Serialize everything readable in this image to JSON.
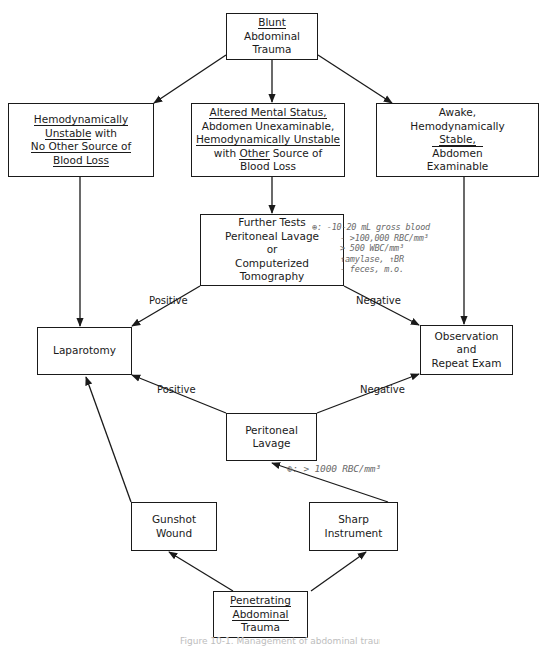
{
  "diagram": {
    "nodes": {
      "blunt": {
        "lines": [
          [
            "Blunt",
            "u"
          ],
          [
            "Abdominal",
            ""
          ],
          [
            "Trauma",
            ""
          ]
        ]
      },
      "unstable": {
        "lines": [
          [
            "Hemodynamically",
            "u"
          ],
          [
            "Unstable",
            "u",
            " with"
          ],
          [
            "No Other Source of",
            "u"
          ],
          [
            "Blood Loss",
            "u"
          ]
        ]
      },
      "altered": {
        "lines": [
          [
            "Altered Mental Status,",
            "u"
          ],
          [
            "Abdomen Unexaminable,",
            ""
          ],
          [
            "Hemodynamically Unstable",
            "u"
          ],
          [
            "with ",
            "",
            "Other",
            "u",
            " Source of"
          ],
          [
            "Blood",
            "o",
            " Loss"
          ]
        ]
      },
      "awake": {
        "lines": [
          [
            "Awake,",
            ""
          ],
          [
            "Hemodynamically",
            ""
          ],
          [
            "Stable,",
            "u"
          ],
          [
            "Abdomen",
            "o"
          ],
          [
            "Examinable",
            ""
          ]
        ]
      },
      "further": {
        "lines": [
          [
            "Further Tests",
            ""
          ],
          [
            "Peritoneal Lavage",
            ""
          ],
          [
            "or",
            ""
          ],
          [
            "Computerized",
            ""
          ],
          [
            "Tomography",
            ""
          ]
        ]
      },
      "laparotomy": {
        "lines": [
          [
            "Laparotomy",
            ""
          ]
        ]
      },
      "observation": {
        "lines": [
          [
            "Observation",
            ""
          ],
          [
            "and",
            ""
          ],
          [
            "Repeat Exam",
            ""
          ]
        ]
      },
      "lavage": {
        "lines": [
          [
            "Peritoneal",
            ""
          ],
          [
            "Lavage",
            ""
          ]
        ]
      },
      "gunshot": {
        "lines": [
          [
            "Gunshot",
            ""
          ],
          [
            "Wound",
            ""
          ]
        ]
      },
      "sharp": {
        "lines": [
          [
            "Sharp",
            ""
          ],
          [
            "Instrument",
            ""
          ]
        ]
      },
      "penetrating": {
        "lines": [
          [
            "Penetrating",
            "u"
          ],
          [
            "Abdominal",
            "u"
          ],
          [
            "Trauma",
            ""
          ]
        ]
      }
    },
    "edge_labels": {
      "further_positive": "Positive",
      "further_negative": "Negative",
      "lavage_positive": "Positive",
      "lavage_negative": "Negative"
    },
    "annotations": {
      "further_criteria": [
        "⊕: -10-20 mL gross blood",
        "- >100,000 RBC/mm³",
        "  > 500 WBC/mm³",
        "  ↑amylase, ↑BR",
        "  - feces, m.o."
      ],
      "lavage_criteria": "⊕: > 1000 RBC/mm³"
    },
    "caption": "Figure 10-1. Management of abdominal trauma"
  }
}
